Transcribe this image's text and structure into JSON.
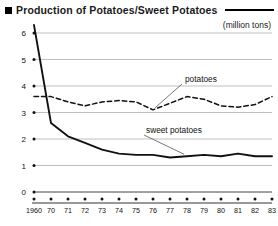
{
  "header": {
    "bullet_icon": "square-bullet-icon",
    "title": "Production of Potatoes/Sweet Potatoes",
    "unit": "(million tons)"
  },
  "chart_data": {
    "type": "line",
    "title": "Production of Potatoes/Sweet Potatoes",
    "subtitle": "",
    "xlabel": "",
    "ylabel": "",
    "unit": "(million tons)",
    "grid": true,
    "legend_position": "inline-annotation",
    "xlim": [
      0,
      14
    ],
    "ylim": [
      0,
      6
    ],
    "yticks": [
      0,
      1,
      2,
      3,
      4,
      5,
      6
    ],
    "ytick_labels": [
      "0",
      "1",
      "2",
      "3",
      "4",
      "5",
      "6"
    ],
    "x": [
      "1960",
      "70",
      "71",
      "72",
      "73",
      "74",
      "75",
      "76",
      "77",
      "78",
      "79",
      "80",
      "81",
      "82",
      "83"
    ],
    "xtick_labels": [
      "1960",
      "70",
      "71",
      "72",
      "73",
      "74",
      "75",
      "76",
      "77",
      "78",
      "79",
      "80",
      "81",
      "82",
      "83"
    ],
    "series": [
      {
        "name": "potatoes",
        "style": "dashed",
        "color": "#111111",
        "label": "potatoes",
        "values": [
          3.6,
          3.6,
          3.4,
          3.25,
          3.4,
          3.45,
          3.4,
          3.1,
          3.35,
          3.6,
          3.5,
          3.25,
          3.2,
          3.3,
          3.6
        ]
      },
      {
        "name": "sweet potatoes",
        "style": "solid",
        "color": "#111111",
        "label": "sweet potatoes",
        "values": [
          6.3,
          2.6,
          2.1,
          1.85,
          1.6,
          1.45,
          1.4,
          1.4,
          1.3,
          1.35,
          1.4,
          1.35,
          1.45,
          1.35,
          1.35
        ]
      }
    ],
    "annotations": [
      {
        "text": "potatoes",
        "target_series": "potatoes",
        "target_x": "78"
      },
      {
        "text": "sweet potatoes",
        "target_series": "sweet potatoes",
        "target_x": "78"
      }
    ]
  }
}
